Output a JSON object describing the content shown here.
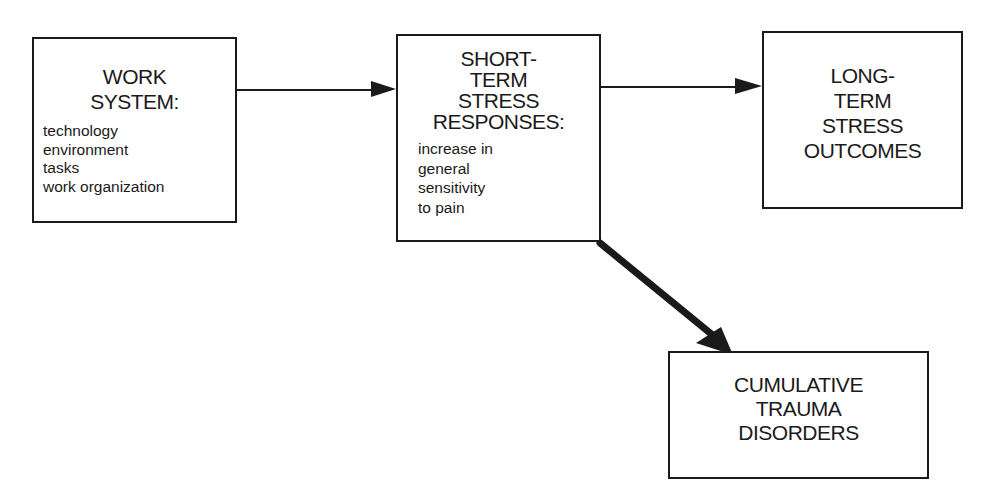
{
  "diagram": {
    "nodes": [
      {
        "id": "work-system",
        "title_lines": [
          "WORK",
          "SYSTEM:"
        ],
        "items": [
          "technology",
          "environment",
          "tasks",
          "work organization"
        ]
      },
      {
        "id": "short-term-stress-responses",
        "title_lines": [
          "SHORT-",
          "TERM",
          "STRESS",
          "RESPONSES:"
        ],
        "items": [
          "increase in",
          "general",
          "sensitivity",
          "to pain"
        ]
      },
      {
        "id": "long-term-stress-outcomes",
        "title_lines": [
          "LONG-",
          "TERM",
          "STRESS",
          "OUTCOMES"
        ],
        "items": []
      },
      {
        "id": "cumulative-trauma-disorders",
        "title_lines": [
          "CUMULATIVE",
          "TRAUMA",
          "DISORDERS"
        ],
        "items": []
      }
    ],
    "edges": [
      {
        "from": "work-system",
        "to": "short-term-stress-responses",
        "style": "thin"
      },
      {
        "from": "short-term-stress-responses",
        "to": "long-term-stress-outcomes",
        "style": "thin"
      },
      {
        "from": "short-term-stress-responses",
        "to": "cumulative-trauma-disorders",
        "style": "thick"
      }
    ],
    "colors": {
      "line": "#1a1a1a",
      "background": "#ffffff"
    }
  }
}
